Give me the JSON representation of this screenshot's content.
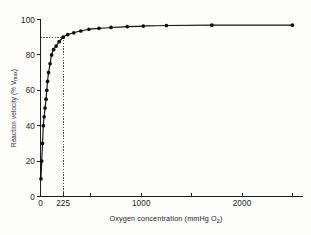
{
  "chart_data": {
    "type": "line",
    "title": "",
    "xlabel": "Oxygen concentration (mmHg O",
    "xlabel_sub": "2",
    "xlabel_tail": ")",
    "ylabel": "Reaction velocity (% V",
    "ylabel_sub": "max",
    "ylabel_tail": ")",
    "xlim": [
      0,
      2600
    ],
    "ylim": [
      0,
      100
    ],
    "grid": false,
    "legend": "none",
    "xticks": [
      0,
      225,
      500,
      1000,
      1500,
      2000,
      2500
    ],
    "xtick_labels": [
      "0",
      "225",
      "",
      "1000",
      "",
      "2000",
      ""
    ],
    "yticks": [
      0,
      20,
      40,
      60,
      80,
      100
    ],
    "ytick_labels": [
      "0",
      "20",
      "40",
      "60",
      "80",
      "100"
    ],
    "x": [
      5,
      12,
      20,
      28,
      36,
      45,
      55,
      62,
      70,
      80,
      95,
      110,
      130,
      155,
      185,
      225,
      270,
      330,
      400,
      480,
      580,
      700,
      860,
      1020,
      1250,
      1700,
      2500
    ],
    "y": [
      10,
      20,
      30,
      40,
      45,
      50,
      55,
      60,
      65,
      70,
      75,
      80,
      83,
      85,
      87.5,
      90,
      91.5,
      92.5,
      93.5,
      94.5,
      95,
      95.5,
      96,
      96.3,
      96.6,
      96.8,
      96.8
    ],
    "annotations": [
      {
        "name": "reference-line-horizontal",
        "value": 90,
        "axis": "y",
        "style": "dotted"
      },
      {
        "name": "reference-line-vertical",
        "value": 225,
        "axis": "x",
        "style": "dotted"
      }
    ]
  }
}
